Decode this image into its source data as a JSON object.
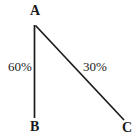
{
  "diagram": {
    "type": "line-diagram",
    "background_color": "#ffffff",
    "stroke_color": "#1a1a1a",
    "text_color": "#1a1a1a",
    "canvas": {
      "width": 139,
      "height": 140
    },
    "nodes": [
      {
        "id": "A",
        "label": "A",
        "x": 34.5,
        "y": 25
      },
      {
        "id": "B",
        "label": "B",
        "x": 34.5,
        "y": 118
      },
      {
        "id": "C",
        "label": "C",
        "x": 124,
        "y": 120
      }
    ],
    "edges": [
      {
        "id": "AB",
        "from": "A",
        "to": "B",
        "label": "60%",
        "x1": 34.5,
        "y1": 25,
        "x2": 34.5,
        "y2": 118
      },
      {
        "id": "AC",
        "from": "A",
        "to": "C",
        "label": "30%",
        "x1": 35.5,
        "y1": 25.5,
        "x2": 124,
        "y2": 120
      }
    ]
  }
}
